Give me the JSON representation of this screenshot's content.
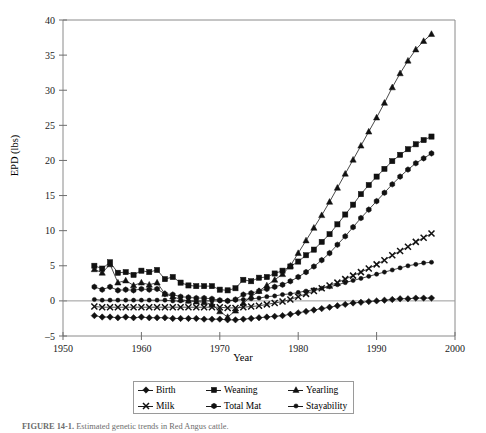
{
  "figure": {
    "caption_label": "FIGURE 14-1.",
    "caption_text": "Estimated genetic trends in Red Angus cattle."
  },
  "axes": {
    "ylabel": "EPD (lbs)",
    "xlabel": "Year",
    "yticks": [
      -5,
      0,
      5,
      10,
      15,
      20,
      25,
      30,
      35,
      40
    ],
    "xticks": [
      1950,
      1960,
      1970,
      1980,
      1990,
      2000
    ]
  },
  "legend": {
    "items": [
      {
        "label": "Birth",
        "marker": "diamond-marker"
      },
      {
        "label": "Weaning",
        "marker": "square-marker"
      },
      {
        "label": "Yearling",
        "marker": "triangle-marker"
      },
      {
        "label": "Milk",
        "marker": "cross-marker"
      },
      {
        "label": "Total Mat",
        "marker": "hexagon-marker"
      },
      {
        "label": "Stayability",
        "marker": "circle-marker"
      }
    ]
  },
  "chart_data": {
    "type": "line",
    "title": "",
    "xlabel": "Year",
    "ylabel": "EPD (lbs)",
    "xlim": [
      1950,
      2000
    ],
    "ylim": [
      -5,
      40
    ],
    "grid": false,
    "legend_position": "bottom",
    "x": [
      1954,
      1955,
      1956,
      1957,
      1958,
      1959,
      1960,
      1961,
      1962,
      1963,
      1964,
      1965,
      1966,
      1967,
      1968,
      1969,
      1970,
      1971,
      1972,
      1973,
      1974,
      1975,
      1976,
      1977,
      1978,
      1979,
      1980,
      1981,
      1982,
      1983,
      1984,
      1985,
      1986,
      1987,
      1988,
      1989,
      1990,
      1991,
      1992,
      1993,
      1994,
      1995,
      1996,
      1997
    ],
    "series": [
      {
        "name": "Birth",
        "marker": "diamond-marker",
        "values": [
          -2.1,
          -2.3,
          -2.3,
          -2.4,
          -2.3,
          -2.4,
          -2.3,
          -2.4,
          -2.4,
          -2.4,
          -2.5,
          -2.5,
          -2.5,
          -2.5,
          -2.6,
          -2.6,
          -2.6,
          -2.7,
          -2.7,
          -2.6,
          -2.5,
          -2.4,
          -2.3,
          -2.2,
          -2.1,
          -1.9,
          -1.7,
          -1.5,
          -1.3,
          -1.1,
          -0.9,
          -0.7,
          -0.5,
          -0.3,
          -0.2,
          -0.1,
          0.0,
          0.1,
          0.2,
          0.3,
          0.3,
          0.4,
          0.4,
          0.4
        ]
      },
      {
        "name": "Weaning",
        "marker": "square-marker",
        "values": [
          5.0,
          4.6,
          5.5,
          4.0,
          4.1,
          3.7,
          4.3,
          4.1,
          4.4,
          3.1,
          3.4,
          2.6,
          2.2,
          2.1,
          2.1,
          2.1,
          1.6,
          1.5,
          1.8,
          3.0,
          2.8,
          3.3,
          3.4,
          3.9,
          4.3,
          4.9,
          5.6,
          6.5,
          7.3,
          8.4,
          9.5,
          10.9,
          12.3,
          13.7,
          15.2,
          16.5,
          17.7,
          18.8,
          19.9,
          20.8,
          21.6,
          22.3,
          22.9,
          23.4
        ]
      },
      {
        "name": "Yearling",
        "marker": "triangle-marker",
        "values": [
          4.5,
          4.0,
          5.2,
          2.6,
          2.9,
          2.2,
          2.6,
          2.3,
          2.6,
          1.0,
          0.6,
          0.2,
          0.0,
          -0.1,
          -0.2,
          -0.5,
          -1.5,
          -2.3,
          -1.4,
          -0.3,
          0.6,
          1.4,
          2.2,
          3.0,
          3.8,
          5.0,
          6.8,
          8.6,
          10.4,
          12.2,
          14.1,
          16.1,
          18.1,
          20.1,
          22.1,
          24.1,
          26.1,
          28.2,
          30.4,
          32.4,
          34.2,
          35.8,
          37.0,
          38.0
        ]
      },
      {
        "name": "Milk",
        "marker": "cross-marker",
        "values": [
          -0.8,
          -0.9,
          -0.9,
          -0.9,
          -0.9,
          -0.9,
          -0.9,
          -0.9,
          -0.9,
          -0.9,
          -0.9,
          -0.9,
          -0.9,
          -0.9,
          -0.9,
          -0.9,
          -0.9,
          -1.0,
          -1.0,
          -0.9,
          -0.8,
          -0.7,
          -0.5,
          -0.3,
          -0.1,
          0.2,
          0.6,
          1.0,
          1.4,
          1.8,
          2.2,
          2.6,
          3.1,
          3.6,
          4.1,
          4.6,
          5.2,
          5.8,
          6.5,
          7.1,
          7.7,
          8.4,
          9.0,
          9.6
        ]
      },
      {
        "name": "Total Mat",
        "marker": "hexagon-marker",
        "values": [
          2.0,
          1.6,
          2.0,
          1.5,
          1.6,
          1.5,
          1.7,
          1.6,
          1.7,
          1.0,
          0.9,
          0.6,
          0.5,
          0.4,
          0.4,
          0.3,
          0.1,
          0.0,
          0.2,
          0.9,
          1.1,
          1.4,
          1.7,
          2.0,
          2.3,
          2.8,
          3.4,
          4.1,
          4.9,
          5.8,
          6.8,
          8.0,
          9.2,
          10.5,
          11.8,
          13.0,
          14.2,
          15.4,
          16.6,
          17.7,
          18.7,
          19.6,
          20.3,
          21.0
        ]
      },
      {
        "name": "Stayability",
        "marker": "circle-marker",
        "values": [
          0.2,
          0.1,
          0.1,
          0.1,
          0.1,
          0.1,
          0.1,
          0.1,
          0.1,
          0.1,
          0.0,
          0.0,
          0.0,
          0.0,
          0.0,
          0.0,
          0.0,
          0.0,
          0.1,
          0.2,
          0.3,
          0.4,
          0.6,
          0.7,
          0.9,
          1.0,
          1.2,
          1.4,
          1.6,
          1.8,
          2.0,
          2.3,
          2.6,
          2.9,
          3.2,
          3.5,
          3.8,
          4.1,
          4.4,
          4.7,
          5.0,
          5.2,
          5.4,
          5.5
        ]
      }
    ]
  }
}
